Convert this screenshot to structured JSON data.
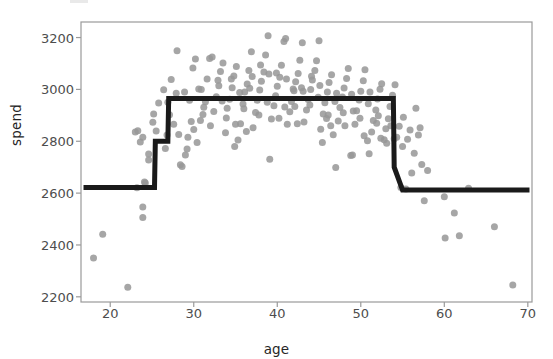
{
  "figure": {
    "background": "#ffffff",
    "plot_area": {
      "left": 81,
      "top": 22,
      "right": 532,
      "bottom": 302
    },
    "frame_color": "#9a9a9a"
  },
  "chart_data": {
    "type": "scatter",
    "title": "",
    "xlabel": "age",
    "ylabel": "spend",
    "xlim": [
      16.5,
      70.5
    ],
    "ylim": [
      2180,
      3260
    ],
    "xticks": [
      20,
      30,
      40,
      50,
      60,
      70
    ],
    "yticks": [
      2200,
      2400,
      2600,
      2800,
      3000,
      3200
    ],
    "grid": false,
    "legend": null,
    "series": [
      {
        "name": "observations",
        "type": "scatter",
        "color": "#969696",
        "marker": "circle",
        "marker_size": 7,
        "opacity": 0.85,
        "points": [
          [
            18.0,
            2350
          ],
          [
            19.1,
            2441
          ],
          [
            22.1,
            2237
          ],
          [
            23.9,
            2506
          ],
          [
            23.9,
            2546
          ],
          [
            23.2,
            2621
          ],
          [
            24.1,
            2643
          ],
          [
            24.2,
            2639
          ],
          [
            24.6,
            2751
          ],
          [
            24.6,
            2728
          ],
          [
            23.0,
            2836
          ],
          [
            23.3,
            2841
          ],
          [
            23.6,
            2797
          ],
          [
            23.9,
            2815
          ],
          [
            25.1,
            2873
          ],
          [
            25.2,
            2905
          ],
          [
            25.5,
            2840
          ],
          [
            25.8,
            2948
          ],
          [
            26.4,
            2999
          ],
          [
            26.6,
            2772
          ],
          [
            26.8,
            2824
          ],
          [
            27.3,
            3038
          ],
          [
            28.0,
            3149
          ],
          [
            27.1,
            2902
          ],
          [
            27.6,
            2866
          ],
          [
            28.4,
            2709
          ],
          [
            28.6,
            2703
          ],
          [
            29.0,
            2747
          ],
          [
            29.3,
            2815
          ],
          [
            29.5,
            2958
          ],
          [
            29.9,
            3083
          ],
          [
            30.2,
            3117
          ],
          [
            30.0,
            2845
          ],
          [
            30.4,
            2795
          ],
          [
            30.8,
            2880
          ],
          [
            31.1,
            2903
          ],
          [
            31.4,
            2952
          ],
          [
            31.6,
            3040
          ],
          [
            31.9,
            3119
          ],
          [
            32.2,
            3125
          ],
          [
            32.0,
            2860
          ],
          [
            32.4,
            2915
          ],
          [
            32.7,
            2972
          ],
          [
            33.0,
            3014
          ],
          [
            33.2,
            3069
          ],
          [
            33.5,
            3102
          ],
          [
            33.8,
            2833
          ],
          [
            34.0,
            2927
          ],
          [
            34.3,
            2962
          ],
          [
            34.6,
            3006
          ],
          [
            34.8,
            3052
          ],
          [
            35.1,
            3088
          ],
          [
            35.3,
            2805
          ],
          [
            35.6,
            2868
          ],
          [
            35.9,
            2944
          ],
          [
            36.1,
            2990
          ],
          [
            36.4,
            3021
          ],
          [
            36.6,
            3073
          ],
          [
            36.9,
            3145
          ],
          [
            37.1,
            2852
          ],
          [
            37.4,
            2911
          ],
          [
            37.6,
            2958
          ],
          [
            37.9,
            2998
          ],
          [
            38.1,
            3031
          ],
          [
            38.4,
            3067
          ],
          [
            38.6,
            3133
          ],
          [
            38.9,
            3207
          ],
          [
            39.1,
            2731
          ],
          [
            39.3,
            2886
          ],
          [
            39.6,
            2937
          ],
          [
            39.8,
            2976
          ],
          [
            40.0,
            3012
          ],
          [
            40.3,
            3047
          ],
          [
            40.5,
            3093
          ],
          [
            40.8,
            3185
          ],
          [
            41.0,
            3196
          ],
          [
            41.2,
            2866
          ],
          [
            41.5,
            2914
          ],
          [
            41.7,
            2953
          ],
          [
            42.0,
            2995
          ],
          [
            42.2,
            3030
          ],
          [
            42.5,
            3061
          ],
          [
            42.7,
            3112
          ],
          [
            43.0,
            3180
          ],
          [
            43.2,
            2874
          ],
          [
            43.5,
            2921
          ],
          [
            43.7,
            2961
          ],
          [
            44.0,
            3000
          ],
          [
            44.2,
            3036
          ],
          [
            44.5,
            3073
          ],
          [
            44.7,
            3111
          ],
          [
            45.0,
            3188
          ],
          [
            45.2,
            2846
          ],
          [
            45.5,
            2905
          ],
          [
            45.7,
            2949
          ],
          [
            46.0,
            2990
          ],
          [
            46.2,
            3027
          ],
          [
            46.5,
            3057
          ],
          [
            46.7,
            2825
          ],
          [
            47.0,
            2699
          ],
          [
            47.3,
            2878
          ],
          [
            47.5,
            2930
          ],
          [
            47.8,
            2971
          ],
          [
            48.0,
            3005
          ],
          [
            48.3,
            3042
          ],
          [
            48.5,
            3081
          ],
          [
            48.8,
            2745
          ],
          [
            49.0,
            2747
          ],
          [
            49.3,
            2866
          ],
          [
            49.5,
            2918
          ],
          [
            49.8,
            2959
          ],
          [
            50.0,
            2993
          ],
          [
            50.3,
            3033
          ],
          [
            50.5,
            3076
          ],
          [
            50.8,
            2802
          ],
          [
            51.0,
            2752
          ],
          [
            51.3,
            2836
          ],
          [
            51.5,
            2880
          ],
          [
            51.8,
            2921
          ],
          [
            52.0,
            2963
          ],
          [
            52.3,
            3001
          ],
          [
            52.5,
            3022
          ],
          [
            52.8,
            2806
          ],
          [
            53.0,
            2848
          ],
          [
            53.3,
            2887
          ],
          [
            53.5,
            2934
          ],
          [
            53.8,
            2977
          ],
          [
            54.1,
            3018
          ],
          [
            54.3,
            2815
          ],
          [
            54.6,
            2858
          ],
          [
            54.8,
            2622
          ],
          [
            55.1,
            2893
          ],
          [
            55.4,
            2616
          ],
          [
            55.6,
            2808
          ],
          [
            55.9,
            2843
          ],
          [
            56.1,
            2678
          ],
          [
            56.4,
            2754
          ],
          [
            56.6,
            2927
          ],
          [
            56.9,
            2824
          ],
          [
            57.1,
            2852
          ],
          [
            57.3,
            2710
          ],
          [
            57.6,
            2571
          ],
          [
            58.0,
            2687
          ],
          [
            60.0,
            2586
          ],
          [
            60.1,
            2427
          ],
          [
            61.2,
            2523
          ],
          [
            61.8,
            2436
          ],
          [
            62.9,
            2619
          ],
          [
            66.0,
            2470
          ],
          [
            68.2,
            2246
          ],
          [
            28.9,
            2990
          ],
          [
            30.6,
            3002
          ],
          [
            33.9,
            2890
          ],
          [
            35.0,
            2866
          ],
          [
            36.7,
            3004
          ],
          [
            37.8,
            2901
          ],
          [
            39.0,
            3059
          ],
          [
            41.9,
            3002
          ],
          [
            43.9,
            2940
          ],
          [
            45.9,
            2888
          ],
          [
            47.9,
            2910
          ],
          [
            49.9,
            2889
          ],
          [
            51.9,
            2869
          ],
          [
            29.7,
            2876
          ],
          [
            31.2,
            2931
          ],
          [
            34.5,
            3040
          ],
          [
            38.0,
            3094
          ],
          [
            40.9,
            2932
          ],
          [
            42.9,
            3006
          ],
          [
            44.9,
            2970
          ],
          [
            46.9,
            2953
          ],
          [
            48.9,
            2981
          ],
          [
            50.9,
            2945
          ],
          [
            26.9,
            2950
          ],
          [
            27.9,
            2985
          ],
          [
            32.9,
            3035
          ],
          [
            35.5,
            2988
          ],
          [
            37.0,
            3050
          ],
          [
            39.9,
            3063
          ],
          [
            42.1,
            2934
          ],
          [
            44.1,
            3051
          ],
          [
            46.1,
            2901
          ],
          [
            48.1,
            2860
          ],
          [
            52.1,
            2898
          ],
          [
            53.1,
            2792
          ],
          [
            54.0,
            2810
          ],
          [
            30.9,
            3000
          ],
          [
            33.4,
            2955
          ],
          [
            36.0,
            2925
          ],
          [
            38.8,
            2950
          ],
          [
            41.1,
            3040
          ],
          [
            43.1,
            2993
          ],
          [
            45.1,
            3015
          ],
          [
            47.1,
            2985
          ],
          [
            49.1,
            2917
          ],
          [
            51.1,
            2990
          ],
          [
            28.2,
            2826
          ],
          [
            29.2,
            2770
          ],
          [
            34.9,
            2780
          ],
          [
            36.3,
            2838
          ],
          [
            40.2,
            2889
          ],
          [
            42.4,
            2868
          ],
          [
            45.4,
            2795
          ],
          [
            46.4,
            2860
          ],
          [
            50.4,
            2821
          ],
          [
            52.4,
            2812
          ],
          [
            53.6,
            2860
          ],
          [
            55.0,
            2780
          ]
        ]
      },
      {
        "name": "fitted step function",
        "type": "step",
        "color": "#1a1a1a",
        "line_width": 5,
        "vertices": [
          [
            16.8,
            2622
          ],
          [
            25.3,
            2622
          ],
          [
            25.4,
            2800
          ],
          [
            26.9,
            2800
          ],
          [
            27.0,
            2965
          ],
          [
            53.9,
            2965
          ],
          [
            54.0,
            2700
          ],
          [
            55.0,
            2612
          ],
          [
            70.2,
            2612
          ]
        ]
      }
    ]
  },
  "ticks": {
    "x": [
      {
        "value": 20,
        "label": "20"
      },
      {
        "value": 30,
        "label": "30"
      },
      {
        "value": 40,
        "label": "40"
      },
      {
        "value": 50,
        "label": "50"
      },
      {
        "value": 60,
        "label": "60"
      },
      {
        "value": 70,
        "label": "70"
      }
    ],
    "y": [
      {
        "value": 2200,
        "label": "2200"
      },
      {
        "value": 2400,
        "label": "2400"
      },
      {
        "value": 2600,
        "label": "2600"
      },
      {
        "value": 2800,
        "label": "2800"
      },
      {
        "value": 3000,
        "label": "3000"
      },
      {
        "value": 3200,
        "label": "3200"
      }
    ]
  }
}
